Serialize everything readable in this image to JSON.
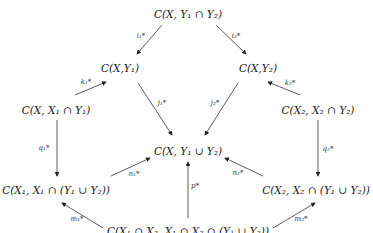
{
  "diagram": {
    "type": "commutative-diagram",
    "nodes": {
      "top": "C(X, Y₁ ∩ Y₂)",
      "left_upper": "C(X,Y₁)",
      "right_upper": "C(X,Y₂)",
      "left_mid": "C(X, X₁ ∩ Y₁)",
      "right_mid": "C(X₂, X₂ ∩ Y₂)",
      "center": "C(X, Y₁ ∪ Y₂)",
      "left_lower": "C(X₁, X₁ ∩ (Y₁ ∪ Y₂))",
      "right_lower": "C(X₂, X₂ ∩ (Y₁ ∪ Y₂))",
      "bottom": "C(X₁ ∩ X₂, X₁ ∩ X₂ ∩ (Y₁ ∪ Y₂))"
    },
    "edges": {
      "i1": "i₁*",
      "i2": "i₂*",
      "k1": "k₁*",
      "k2": "k₂*",
      "j1": "j₁*",
      "j2": "j₂*",
      "q1": "q₁*",
      "q2": "q₂*",
      "n1": "n₁*",
      "n2": "n₂*",
      "p": "p*",
      "m1": "m₁*",
      "m2": "m₂*"
    }
  }
}
